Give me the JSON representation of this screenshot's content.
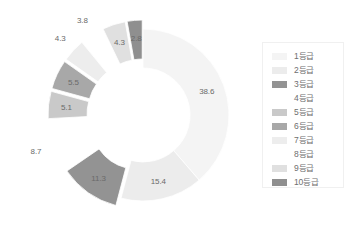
{
  "chart_data": {
    "type": "pie",
    "title": "",
    "subtitle": "",
    "xlabel": "",
    "ylabel": "",
    "donut": true,
    "hole_ratio": 0.55,
    "legend_position": "right",
    "grid": false,
    "start_angle_deg": 0,
    "direction": "clockwise",
    "categories": [
      "1등급",
      "2등급",
      "3등급",
      "4등급",
      "5등급",
      "6등급",
      "7등급",
      "8등급",
      "9등급",
      "10등급"
    ],
    "values": [
      38.6,
      15.4,
      11.3,
      8.7,
      5.1,
      5.5,
      4.3,
      3.8,
      4.3,
      2.8
    ],
    "value_labels": [
      "38.6",
      "15.4",
      "11.3",
      "8.7",
      "5.1",
      "5.5",
      "4.3",
      "3.8",
      "4.3",
      "2.8"
    ],
    "colors": [
      "#f4f4f4",
      "#ececec",
      "#939393",
      "#ffffff",
      "#c9c9c9",
      "#a8a8a8",
      "#ededed",
      "#ffffff",
      "#e0e0e0",
      "#8f8f8f"
    ],
    "exploded": [
      false,
      false,
      true,
      true,
      true,
      true,
      true,
      true,
      true,
      true
    ]
  },
  "legend": {
    "items": [
      {
        "label": "1등급",
        "color": "#f4f4f4"
      },
      {
        "label": "2등급",
        "color": "#ececec"
      },
      {
        "label": "3등급",
        "color": "#939393"
      },
      {
        "label": "4등급",
        "color": "#ffffff"
      },
      {
        "label": "5등급",
        "color": "#c9c9c9"
      },
      {
        "label": "6등급",
        "color": "#a8a8a8"
      },
      {
        "label": "7등급",
        "color": "#ededed"
      },
      {
        "label": "8등급",
        "color": "#ffffff"
      },
      {
        "label": "9등급",
        "color": "#e0e0e0"
      },
      {
        "label": "10등급",
        "color": "#8f8f8f"
      }
    ]
  },
  "geometry": {
    "cx": 143,
    "cy": 115,
    "outer_r": 86,
    "inner_r": 47,
    "explode_offset": 9,
    "label_radius": 68,
    "outside_label_radius": 104
  },
  "style": {
    "label_color": "#6a6a6a",
    "legend_border": "#f0f0f0",
    "background": "#ffffff"
  }
}
